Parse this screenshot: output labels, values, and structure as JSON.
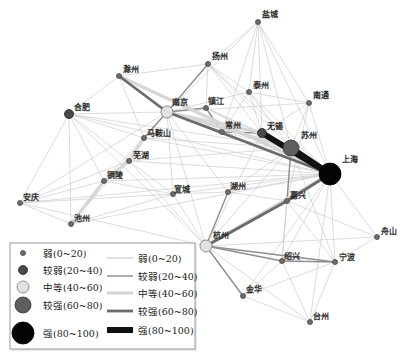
{
  "styles": {
    "node_levels": [
      {
        "r": 2.5,
        "fill": "#6e6e6e",
        "stroke": "#444444"
      },
      {
        "r": 4.5,
        "fill": "#4a4a4a",
        "stroke": "#222222"
      },
      {
        "r": 6,
        "fill": "#e2e2e2",
        "stroke": "#777777"
      },
      {
        "r": 8,
        "fill": "#5e5e5e",
        "stroke": "#333333"
      },
      {
        "r": 11,
        "fill": "#050505",
        "stroke": "#000000"
      }
    ],
    "edge_levels": [
      {
        "width": 0.6,
        "color": "#c4c4c4"
      },
      {
        "width": 1.4,
        "color": "#8e8e8e"
      },
      {
        "width": 3.2,
        "color": "#d6d6d6"
      },
      {
        "width": 2.8,
        "color": "#6c6c6c"
      },
      {
        "width": 6,
        "color": "#111111"
      }
    ],
    "legend_border": "#999999"
  },
  "diagram": {
    "nodes": [
      {
        "name": "盐城",
        "x": 258,
        "y": 22,
        "level": 0,
        "lx": 262,
        "ly": 17
      },
      {
        "name": "扬州",
        "x": 208,
        "y": 64,
        "level": 0,
        "lx": 212,
        "ly": 59
      },
      {
        "name": "泰州",
        "x": 249,
        "y": 92,
        "level": 0,
        "lx": 253,
        "ly": 88
      },
      {
        "name": "南通",
        "x": 309,
        "y": 103,
        "level": 0,
        "lx": 313,
        "ly": 98
      },
      {
        "name": "滁州",
        "x": 119,
        "y": 76,
        "level": 0,
        "lx": 123,
        "ly": 72
      },
      {
        "name": "南京",
        "x": 167,
        "y": 112,
        "level": 2,
        "lx": 172,
        "ly": 105
      },
      {
        "name": "镇江",
        "x": 206,
        "y": 108,
        "level": 0,
        "lx": 208,
        "ly": 104
      },
      {
        "name": "常州",
        "x": 222,
        "y": 132,
        "level": 0,
        "lx": 225,
        "ly": 128
      },
      {
        "name": "无锡",
        "x": 262,
        "y": 133,
        "level": 1,
        "lx": 267,
        "ly": 129
      },
      {
        "name": "苏州",
        "x": 291,
        "y": 148,
        "level": 3,
        "lx": 301,
        "ly": 138
      },
      {
        "name": "上海",
        "x": 330,
        "y": 174,
        "level": 4,
        "lx": 342,
        "ly": 162
      },
      {
        "name": "合肥",
        "x": 69,
        "y": 114,
        "level": 1,
        "lx": 74,
        "ly": 110
      },
      {
        "name": "马鞍山",
        "x": 144,
        "y": 138,
        "level": 0,
        "lx": 147,
        "ly": 136
      },
      {
        "name": "芜湖",
        "x": 129,
        "y": 161,
        "level": 0,
        "lx": 133,
        "ly": 158
      },
      {
        "name": "铜陵",
        "x": 104,
        "y": 181,
        "level": 0,
        "lx": 107,
        "ly": 178
      },
      {
        "name": "安庆",
        "x": 20,
        "y": 203,
        "level": 0,
        "lx": 23,
        "ly": 200
      },
      {
        "name": "池州",
        "x": 71,
        "y": 224,
        "level": 0,
        "lx": 74,
        "ly": 221
      },
      {
        "name": "宣城",
        "x": 173,
        "y": 194,
        "level": 0,
        "lx": 174,
        "ly": 192
      },
      {
        "name": "湖州",
        "x": 228,
        "y": 192,
        "level": 0,
        "lx": 230,
        "ly": 189
      },
      {
        "name": "嘉兴",
        "x": 287,
        "y": 201,
        "level": 0,
        "lx": 290,
        "ly": 198
      },
      {
        "name": "杭州",
        "x": 206,
        "y": 246,
        "level": 2,
        "lx": 213,
        "ly": 238
      },
      {
        "name": "舟山",
        "x": 377,
        "y": 237,
        "level": 0,
        "lx": 381,
        "ly": 234
      },
      {
        "name": "绍兴",
        "x": 282,
        "y": 261,
        "level": 0,
        "lx": 284,
        "ly": 259
      },
      {
        "name": "宁波",
        "x": 335,
        "y": 262,
        "level": 0,
        "lx": 339,
        "ly": 260
      },
      {
        "name": "金华",
        "x": 243,
        "y": 296,
        "level": 0,
        "lx": 246,
        "ly": 292
      },
      {
        "name": "台州",
        "x": 310,
        "y": 322,
        "level": 0,
        "lx": 313,
        "ly": 319
      }
    ],
    "edges": [
      [
        "盐城",
        "扬州",
        0
      ],
      [
        "盐城",
        "泰州",
        0
      ],
      [
        "盐城",
        "南通",
        0
      ],
      [
        "盐城",
        "无锡",
        0
      ],
      [
        "盐城",
        "苏州",
        0
      ],
      [
        "盐城",
        "上海",
        0
      ],
      [
        "盐城",
        "常州",
        0
      ],
      [
        "盐城",
        "南京",
        0
      ],
      [
        "扬州",
        "滁州",
        0
      ],
      [
        "扬州",
        "镇江",
        0
      ],
      [
        "扬州",
        "泰州",
        0
      ],
      [
        "扬州",
        "无锡",
        0
      ],
      [
        "扬州",
        "苏州",
        0
      ],
      [
        "扬州",
        "上海",
        0
      ],
      [
        "泰州",
        "南京",
        0
      ],
      [
        "泰州",
        "南通",
        0
      ],
      [
        "泰州",
        "无锡",
        0
      ],
      [
        "泰州",
        "苏州",
        0
      ],
      [
        "泰州",
        "上海",
        0
      ],
      [
        "泰州",
        "常州",
        0
      ],
      [
        "南通",
        "苏州",
        0
      ],
      [
        "南通",
        "上海",
        0
      ],
      [
        "南通",
        "无锡",
        0
      ],
      [
        "南通",
        "南京",
        0
      ],
      [
        "南通",
        "嘉兴",
        0
      ],
      [
        "滁州",
        "合肥",
        0
      ],
      [
        "滁州",
        "马鞍山",
        0
      ],
      [
        "合肥",
        "南京",
        0
      ],
      [
        "合肥",
        "马鞍山",
        0
      ],
      [
        "合肥",
        "芜湖",
        0
      ],
      [
        "合肥",
        "铜陵",
        0
      ],
      [
        "合肥",
        "安庆",
        0
      ],
      [
        "合肥",
        "池州",
        0
      ],
      [
        "合肥",
        "上海",
        0
      ],
      [
        "合肥",
        "苏州",
        0
      ],
      [
        "合肥",
        "杭州",
        0
      ],
      [
        "安庆",
        "池州",
        0
      ],
      [
        "安庆",
        "铜陵",
        0
      ],
      [
        "安庆",
        "芜湖",
        0
      ],
      [
        "安庆",
        "南京",
        0
      ],
      [
        "安庆",
        "上海",
        0
      ],
      [
        "安庆",
        "宣城",
        0
      ],
      [
        "安庆",
        "杭州",
        0
      ],
      [
        "池州",
        "宣城",
        0
      ],
      [
        "池州",
        "南京",
        0
      ],
      [
        "池州",
        "上海",
        0
      ],
      [
        "铜陵",
        "南京",
        0
      ],
      [
        "铜陵",
        "上海",
        0
      ],
      [
        "铜陵",
        "宣城",
        0
      ],
      [
        "芜湖",
        "宣城",
        0
      ],
      [
        "芜湖",
        "上海",
        0
      ],
      [
        "芜湖",
        "苏州",
        0
      ],
      [
        "芜湖",
        "杭州",
        0
      ],
      [
        "马鞍山",
        "上海",
        0
      ],
      [
        "马鞍山",
        "苏州",
        0
      ],
      [
        "宣城",
        "南京",
        0
      ],
      [
        "宣城",
        "上海",
        0
      ],
      [
        "宣城",
        "杭州",
        0
      ],
      [
        "宣城",
        "湖州",
        0
      ],
      [
        "湖州",
        "上海",
        0
      ],
      [
        "湖州",
        "苏州",
        0
      ],
      [
        "湖州",
        "嘉兴",
        0
      ],
      [
        "湖州",
        "南京",
        0
      ],
      [
        "嘉兴",
        "宁波",
        0
      ],
      [
        "嘉兴",
        "绍兴",
        0
      ],
      [
        "嘉兴",
        "舟山",
        0
      ],
      [
        "舟山",
        "上海",
        0
      ],
      [
        "舟山",
        "宁波",
        0
      ],
      [
        "舟山",
        "杭州",
        0
      ],
      [
        "绍兴",
        "上海",
        0
      ],
      [
        "绍兴",
        "金华",
        0
      ],
      [
        "绍兴",
        "台州",
        0
      ],
      [
        "绍兴",
        "苏州",
        0
      ],
      [
        "宁波",
        "上海",
        0
      ],
      [
        "宁波",
        "台州",
        0
      ],
      [
        "宁波",
        "金华",
        0
      ],
      [
        "宁波",
        "苏州",
        0
      ],
      [
        "金华",
        "台州",
        0
      ],
      [
        "金华",
        "上海",
        0
      ],
      [
        "台州",
        "上海",
        0
      ],
      [
        "台州",
        "杭州",
        0
      ],
      [
        "南京",
        "杭州",
        0
      ],
      [
        "苏州",
        "杭州",
        0
      ],
      [
        "无锡",
        "杭州",
        0
      ],
      [
        "常州",
        "上海",
        0
      ],
      [
        "镇江",
        "上海",
        0
      ],
      [
        "镇江",
        "苏州",
        0
      ],
      [
        "常州",
        "苏州",
        0
      ],
      [
        "镇江",
        "无锡",
        0
      ],
      [
        "南京",
        "镇江",
        1
      ],
      [
        "常州",
        "无锡",
        1
      ],
      [
        "杭州",
        "湖州",
        1
      ],
      [
        "杭州",
        "绍兴",
        1
      ],
      [
        "杭州",
        "宁波",
        1
      ],
      [
        "杭州",
        "金华",
        1
      ],
      [
        "绍兴",
        "宁波",
        1
      ],
      [
        "南京",
        "扬州",
        1
      ],
      [
        "镇江",
        "常州",
        1
      ],
      [
        "苏州",
        "嘉兴",
        1
      ],
      [
        "南京",
        "常州",
        1
      ],
      [
        "南京",
        "马鞍山",
        1
      ],
      [
        "南京",
        "苏州",
        2
      ],
      [
        "南京",
        "无锡",
        2
      ],
      [
        "滁州",
        "上海",
        2
      ],
      [
        "杭州",
        "上海",
        2
      ],
      [
        "马鞍山",
        "芜湖",
        2
      ],
      [
        "芜湖",
        "铜陵",
        2
      ],
      [
        "铜陵",
        "池州",
        2
      ],
      [
        "南京",
        "上海",
        3
      ],
      [
        "嘉兴",
        "上海",
        3
      ],
      [
        "杭州",
        "嘉兴",
        3
      ],
      [
        "苏州",
        "无锡",
        3
      ],
      [
        "南京",
        "滁州",
        3
      ],
      [
        "上海",
        "无锡",
        4
      ],
      [
        "上海",
        "苏州",
        4
      ]
    ]
  },
  "legend": {
    "node_items": [
      {
        "label": "弱(0~20)"
      },
      {
        "label": "较弱(20~40)"
      },
      {
        "label": "中等(40~60)"
      },
      {
        "label": "较强(60~80)"
      },
      {
        "label": "强(80~100)"
      }
    ],
    "edge_items": [
      {
        "label": "弱(0~20)"
      },
      {
        "label": "较弱(20~40)"
      },
      {
        "label": "中等(40~60)"
      },
      {
        "label": "较强(60~80)"
      },
      {
        "label": "强(80~100)"
      }
    ]
  }
}
